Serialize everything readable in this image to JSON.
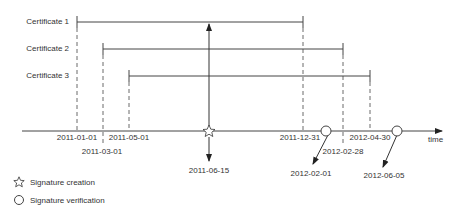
{
  "certificates": [
    {
      "label": "Certificate 1",
      "start": "2011-01-01",
      "end": "2011-12-31"
    },
    {
      "label": "Certificate 2",
      "start": "2011-03-01",
      "end": "2012-02-28"
    },
    {
      "label": "Certificate 3",
      "start": "2011-05-01",
      "end": "2012-04-30"
    }
  ],
  "axis": {
    "label": "time"
  },
  "dates": {
    "d1": "2011-01-01",
    "d2": "2011-03-01",
    "d3": "2011-05-01",
    "d4": "2011-06-15",
    "d5": "2011-12-31",
    "d6": "2012-02-01",
    "d7": "2012-02-28",
    "d8": "2012-04-30",
    "d9": "2012-06-05"
  },
  "legend": {
    "creation": "Signature creation",
    "verification": "Signature verification"
  },
  "colors": {
    "line": "#444444",
    "text": "#333333"
  }
}
